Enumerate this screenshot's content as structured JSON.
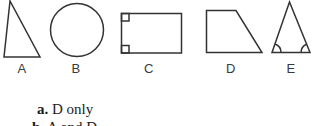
{
  "figure": {
    "shapes": [
      {
        "label": "A",
        "type": "right-triangle"
      },
      {
        "label": "B",
        "type": "circle"
      },
      {
        "label": "C",
        "type": "rectangle-with-right-angle-marks"
      },
      {
        "label": "D",
        "type": "right-trapezoid"
      },
      {
        "label": "E",
        "type": "isosceles-triangle-with-base-angle-arcs"
      }
    ]
  },
  "options": [
    {
      "letter": "a.",
      "text": "D only"
    },
    {
      "letter": "b.",
      "text": "A and D"
    }
  ],
  "colors": {
    "stroke": "#333333",
    "background": "#ffffff",
    "text": "#1c1c1c"
  }
}
